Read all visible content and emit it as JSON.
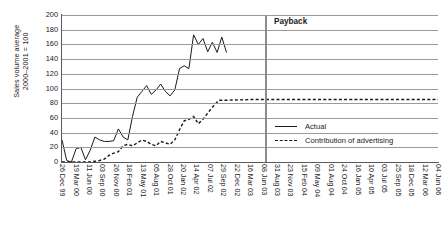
{
  "chart_data": {
    "type": "line",
    "title": "",
    "xlabel": "",
    "ylabel": "Sales volume average\n2000–2001 = 100",
    "ylabel_line1": "Sales volume average",
    "ylabel_line2": "2000–2001 = 100",
    "ylim": [
      0,
      200
    ],
    "yticks": [
      200,
      180,
      160,
      140,
      120,
      100,
      80,
      60,
      40,
      20,
      0
    ],
    "grid": true,
    "legend_position": "right-inside",
    "categories": [
      "26 Dec 99",
      "19 Mar 00",
      "11 Jun 00",
      "03 Sep 00",
      "26 Nov 00",
      "18 Feb 01",
      "13 May 01",
      "05 Aug 01",
      "28 Oct 01",
      "20 Jan 02",
      "14 Apr 02",
      "07 Jul 02",
      "29 Sep 02",
      "22 Dec 02",
      "16 Mar 03",
      "08 Jun 03",
      "31 Aug 03",
      "23 Nov 03",
      "15 Feb 04",
      "09 May 04",
      "01 Aug 04",
      "24 Oct 04",
      "16 Jan 05",
      "10 Apr 05",
      "03 Jul 05",
      "25 Sep 05",
      "18 Dec 05",
      "12 Mar 06",
      "04 Jun 06"
    ],
    "series": [
      {
        "name": "Actual",
        "style": "solid",
        "color": "#1a1a1a",
        "x": [
          0.0,
          0.6,
          1.2,
          1.8,
          2.4,
          3.0,
          3.6,
          4.2,
          4.8,
          5.4,
          6.0,
          6.6,
          7.2,
          7.8,
          8.4,
          9.0,
          9.6,
          10.2,
          10.8,
          11.4,
          12.0,
          12.6,
          13.2,
          13.8,
          14.4,
          15.0,
          15.6,
          16.2,
          16.8,
          17.4,
          18.0,
          18.6,
          19.2,
          19.8,
          20.4,
          21.0
        ],
        "values": [
          30,
          2,
          0,
          18,
          20,
          3,
          16,
          34,
          30,
          28,
          28,
          29,
          45,
          34,
          30,
          62,
          88,
          96,
          104,
          92,
          98,
          106,
          96,
          90,
          98,
          127,
          131,
          127,
          173,
          160,
          168,
          150,
          163,
          149,
          170,
          149
        ]
      },
      {
        "name": "Contribution of advertising",
        "style": "dashed",
        "color": "#1a1a1a",
        "x": [
          0.0,
          0.6,
          1.2,
          1.8,
          2.4,
          3.0,
          3.6,
          4.2,
          4.8,
          5.4,
          6.0,
          6.6,
          7.2,
          7.8,
          8.4,
          9.0,
          9.6,
          10.2,
          10.8,
          11.4,
          12.0,
          12.6,
          13.2,
          13.8,
          14.4,
          15.0,
          15.6,
          16.2,
          16.8,
          17.4,
          18.0,
          19.0,
          20.0,
          21.0,
          24.0,
          28.0,
          32.0,
          36.0,
          40.0,
          44.0,
          48.0
        ],
        "values": [
          0,
          0,
          0,
          0,
          0,
          0,
          0,
          1,
          2,
          4,
          9,
          12,
          14,
          22,
          24,
          22,
          26,
          30,
          28,
          24,
          22,
          28,
          26,
          24,
          30,
          44,
          56,
          58,
          62,
          52,
          58,
          72,
          84,
          84,
          85,
          85,
          85,
          85,
          85,
          85,
          85
        ]
      }
    ],
    "annotations": [
      {
        "name": "payback",
        "label": "Payback",
        "type": "vline",
        "x_label": "08 Jun 03",
        "color": "#8c8c8c"
      }
    ]
  }
}
